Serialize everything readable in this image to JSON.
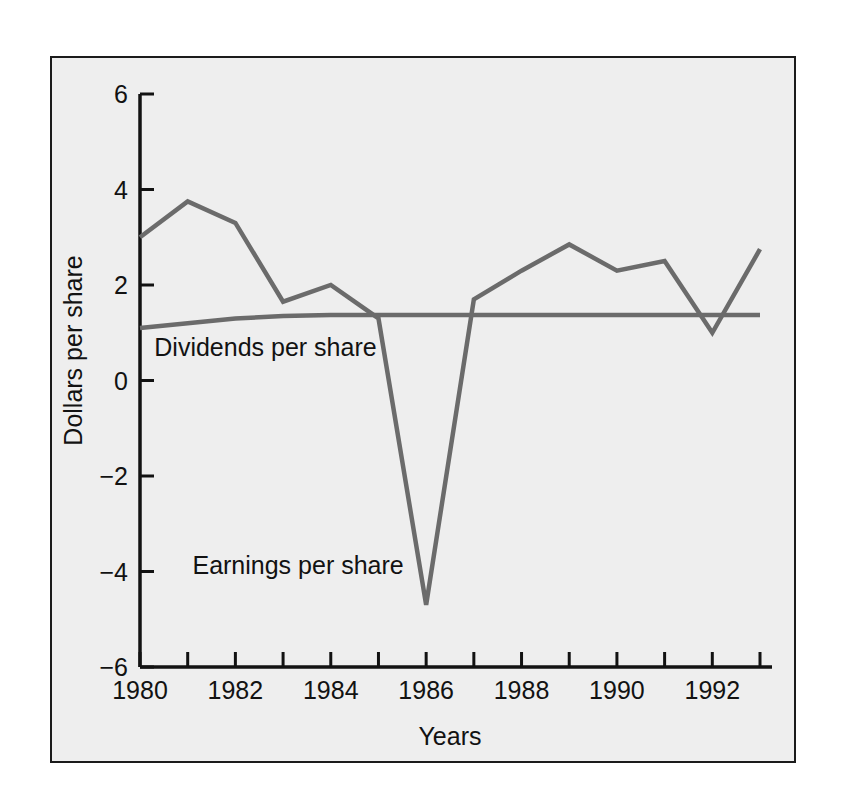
{
  "chart_data": {
    "type": "line",
    "title": "",
    "subtitle": "",
    "xlabel": "Years",
    "ylabel": "Dollars per share",
    "xlim": [
      1980,
      1993
    ],
    "ylim": [
      -6,
      6
    ],
    "grid": false,
    "legend_position": "inline-annotation",
    "x": [
      1980,
      1981,
      1982,
      1983,
      1984,
      1985,
      1986,
      1987,
      1988,
      1989,
      1990,
      1991,
      1992,
      1993
    ],
    "x_tick_values": [
      1980,
      1981,
      1982,
      1983,
      1984,
      1985,
      1986,
      1987,
      1988,
      1989,
      1990,
      1991,
      1992,
      1993
    ],
    "x_tick_labels": [
      "1980",
      "",
      "1982",
      "",
      "1984",
      "",
      "1986",
      "",
      "1988",
      "",
      "1990",
      "",
      "1992",
      ""
    ],
    "x_labeled_ticks": [
      {
        "value": 1980,
        "label": "1980"
      },
      {
        "value": 1982,
        "label": "1982"
      },
      {
        "value": 1984,
        "label": "1984"
      },
      {
        "value": 1986,
        "label": "1986"
      },
      {
        "value": 1988,
        "label": "1988"
      },
      {
        "value": 1990,
        "label": "1990"
      },
      {
        "value": 1992,
        "label": "1992"
      }
    ],
    "y_tick_values": [
      -6,
      -4,
      -2,
      0,
      2,
      4,
      6
    ],
    "y_tick_labels": [
      "−6",
      "−4",
      "−2",
      "0",
      "2",
      "4",
      "6"
    ],
    "series": [
      {
        "name": "Earnings per share",
        "color": "#6b6b6b",
        "annotation": "Earnings per share",
        "values": [
          3.0,
          3.75,
          3.3,
          1.65,
          2.0,
          1.3,
          -4.7,
          1.7,
          2.3,
          2.85,
          2.3,
          2.5,
          1.0,
          2.75
        ]
      },
      {
        "name": "Dividends per share",
        "color": "#6b6b6b",
        "annotation": "Dividends per share",
        "values": [
          1.1,
          1.2,
          1.3,
          1.35,
          1.37,
          1.37,
          1.37,
          1.37,
          1.37,
          1.37,
          1.37,
          1.37,
          1.37,
          1.37
        ]
      }
    ]
  },
  "axes": {
    "x_axis_title": "Years",
    "y_axis_title": "Dollars per share"
  },
  "annotations": {
    "earnings_label": "Earnings per share",
    "dividends_label": "Dividends per share"
  },
  "colors": {
    "series_line": "#6b6b6b",
    "axis": "#121212",
    "frame_border": "#1b1b1b",
    "plot_background": "#eeeeee",
    "page_background": "#ffffff"
  }
}
